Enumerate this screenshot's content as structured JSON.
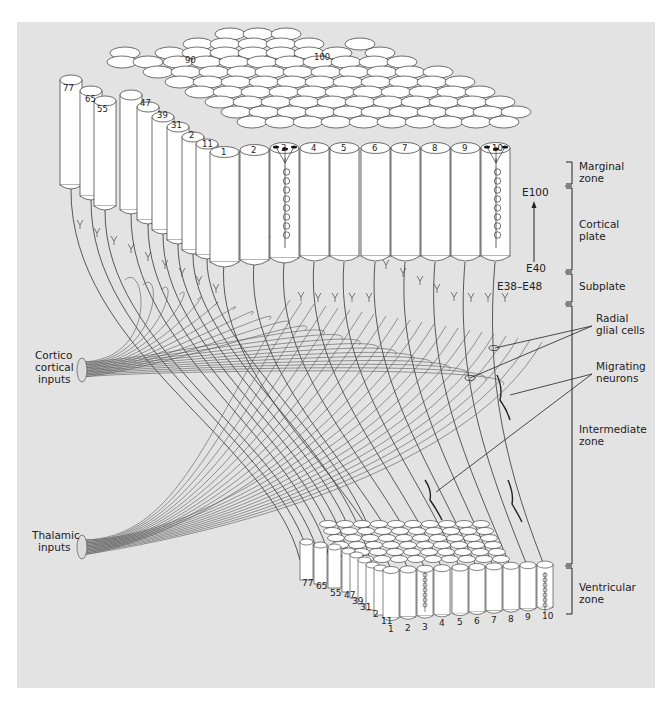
{
  "figure": {
    "background_color": "#e3e3e3",
    "column_fill": "#ffffff",
    "stroke_color": "#333333"
  },
  "cortex_columns": {
    "front_row_labels": [
      "1",
      "2",
      "3",
      "4",
      "5",
      "6",
      "7",
      "8",
      "9",
      "10"
    ],
    "diagonal_labels": [
      "11",
      "2",
      "31",
      "39",
      "47",
      "55",
      "65",
      "77"
    ],
    "back_labels": [
      "90",
      "100"
    ]
  },
  "ventricular_columns": {
    "front_row_labels": [
      "1",
      "2",
      "3",
      "4",
      "5",
      "6",
      "7",
      "8",
      "9",
      "10"
    ],
    "diagonal_labels": [
      "11",
      "2",
      "31",
      "39",
      "47",
      "55",
      "65",
      "77"
    ]
  },
  "time_axis": {
    "top": "E100",
    "bottom": "E40",
    "subplate_period": "E38–E48"
  },
  "zones": [
    {
      "name": "Marginal zone",
      "line1": "Marginal",
      "line2": "zone"
    },
    {
      "name": "Cortical plate",
      "line1": "Cortical",
      "line2": "plate"
    },
    {
      "name": "Subplate",
      "line1": "Subplate",
      "line2": ""
    },
    {
      "name": "Intermediate zone",
      "line1": "Intermediate",
      "line2": "zone"
    },
    {
      "name": "Ventricular zone",
      "line1": "Ventricular",
      "line2": "zone"
    }
  ],
  "callouts": {
    "radial_glial": {
      "line1": "Radial",
      "line2": "glial cells"
    },
    "migrating": {
      "line1": "Migrating",
      "line2": "neurons"
    }
  },
  "inputs": {
    "cortico": {
      "line1": "Cortico",
      "line2": "cortical",
      "line3": "inputs"
    },
    "thalamic": {
      "line1": "Thalamic",
      "line2": "inputs"
    }
  }
}
